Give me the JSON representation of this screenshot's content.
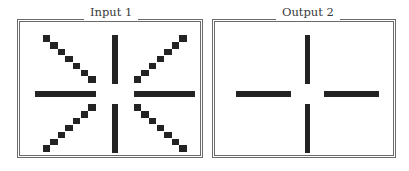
{
  "panels": [
    {
      "id": "input",
      "title": "Input 1",
      "grid_cols": 21,
      "grid_rows": 17,
      "fill_color": "#232323",
      "segments": [
        {
          "name": "bar-north",
          "cells": [
            [
              10,
              0
            ],
            [
              10,
              1
            ],
            [
              10,
              2
            ],
            [
              10,
              3
            ],
            [
              10,
              4
            ],
            [
              10,
              5
            ],
            [
              10,
              6
            ]
          ]
        },
        {
          "name": "bar-south",
          "cells": [
            [
              10,
              10
            ],
            [
              10,
              11
            ],
            [
              10,
              12
            ],
            [
              10,
              13
            ],
            [
              10,
              14
            ],
            [
              10,
              15
            ],
            [
              10,
              16
            ]
          ]
        },
        {
          "name": "bar-west",
          "cells": [
            [
              0,
              8
            ],
            [
              1,
              8
            ],
            [
              2,
              8
            ],
            [
              3,
              8
            ],
            [
              4,
              8
            ],
            [
              5,
              8
            ],
            [
              6,
              8
            ],
            [
              7,
              8
            ]
          ]
        },
        {
          "name": "bar-east",
          "cells": [
            [
              13,
              8
            ],
            [
              14,
              8
            ],
            [
              15,
              8
            ],
            [
              16,
              8
            ],
            [
              17,
              8
            ],
            [
              18,
              8
            ],
            [
              19,
              8
            ],
            [
              20,
              8
            ]
          ]
        },
        {
          "name": "diag-northwest",
          "cells": [
            [
              1,
              0
            ],
            [
              2,
              1
            ],
            [
              3,
              2
            ],
            [
              4,
              3
            ],
            [
              5,
              4
            ],
            [
              6,
              5
            ],
            [
              7,
              6
            ]
          ]
        },
        {
          "name": "diag-northeast",
          "cells": [
            [
              19,
              0
            ],
            [
              18,
              1
            ],
            [
              17,
              2
            ],
            [
              16,
              3
            ],
            [
              15,
              4
            ],
            [
              14,
              5
            ],
            [
              13,
              6
            ]
          ]
        },
        {
          "name": "diag-southwest",
          "cells": [
            [
              7,
              10
            ],
            [
              6,
              11
            ],
            [
              5,
              12
            ],
            [
              4,
              13
            ],
            [
              3,
              14
            ],
            [
              2,
              15
            ],
            [
              1,
              16
            ]
          ]
        },
        {
          "name": "diag-southeast",
          "cells": [
            [
              13,
              10
            ],
            [
              14,
              11
            ],
            [
              15,
              12
            ],
            [
              16,
              13
            ],
            [
              17,
              14
            ],
            [
              18,
              15
            ],
            [
              19,
              16
            ]
          ]
        }
      ]
    },
    {
      "id": "output",
      "title": "Output 2",
      "grid_cols": 21,
      "grid_rows": 17,
      "fill_color": "#232323",
      "segments": [
        {
          "name": "bar-north",
          "cells": [
            [
              10,
              0
            ],
            [
              10,
              1
            ],
            [
              10,
              2
            ],
            [
              10,
              3
            ],
            [
              10,
              4
            ],
            [
              10,
              5
            ],
            [
              10,
              6
            ]
          ]
        },
        {
          "name": "bar-south",
          "cells": [
            [
              10,
              10
            ],
            [
              10,
              11
            ],
            [
              10,
              12
            ],
            [
              10,
              13
            ],
            [
              10,
              14
            ],
            [
              10,
              15
            ],
            [
              10,
              16
            ]
          ]
        },
        {
          "name": "bar-west",
          "cells": [
            [
              0,
              8
            ],
            [
              1,
              8
            ],
            [
              2,
              8
            ],
            [
              3,
              8
            ],
            [
              4,
              8
            ],
            [
              5,
              8
            ],
            [
              6,
              8
            ],
            [
              7,
              8
            ]
          ]
        },
        {
          "name": "bar-east",
          "cells": [
            [
              13,
              8
            ],
            [
              14,
              8
            ],
            [
              15,
              8
            ],
            [
              16,
              8
            ],
            [
              17,
              8
            ],
            [
              18,
              8
            ],
            [
              19,
              8
            ],
            [
              20,
              8
            ]
          ]
        }
      ]
    }
  ]
}
